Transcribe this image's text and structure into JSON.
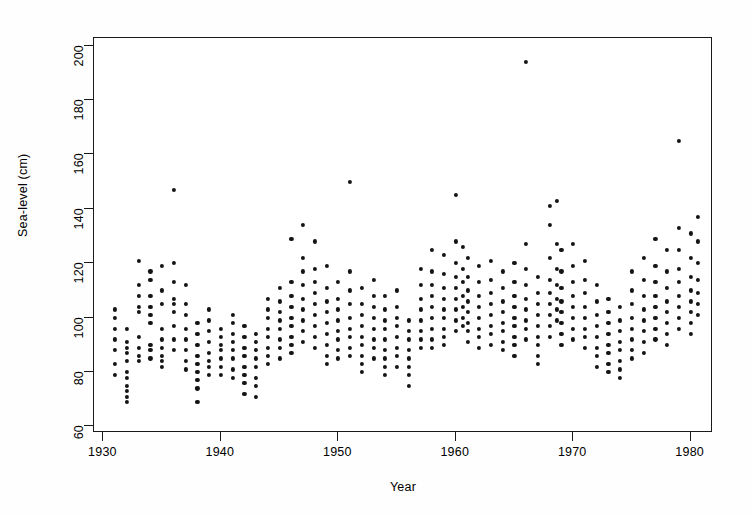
{
  "chart_data": {
    "type": "scatter",
    "title": "",
    "xlabel": "Year",
    "ylabel": "Sea-level (cm)",
    "xlim": [
      1929.2,
      1981.9
    ],
    "ylim": [
      57.6,
      202.8
    ],
    "xticks": [
      1930,
      1940,
      1950,
      1960,
      1970,
      1980
    ],
    "yticks": [
      60,
      80,
      100,
      120,
      140,
      160,
      180,
      200
    ],
    "grid": false,
    "legend": null,
    "marker": "filled-circle",
    "marker_color": "#141414",
    "frame_color": "#1a1a1a",
    "background": "#ffffff",
    "points": [
      [
        1931,
        103
      ],
      [
        1931,
        100
      ],
      [
        1931,
        96
      ],
      [
        1931,
        92
      ],
      [
        1931,
        88
      ],
      [
        1931,
        83
      ],
      [
        1931,
        79
      ],
      [
        1932,
        96
      ],
      [
        1932,
        91
      ],
      [
        1932,
        89
      ],
      [
        1932,
        87
      ],
      [
        1932,
        84
      ],
      [
        1932,
        80
      ],
      [
        1932,
        78
      ],
      [
        1932,
        75
      ],
      [
        1932,
        73
      ],
      [
        1932,
        71
      ],
      [
        1932,
        69
      ],
      [
        1933,
        121
      ],
      [
        1933,
        112
      ],
      [
        1933,
        108
      ],
      [
        1933,
        104
      ],
      [
        1933,
        102
      ],
      [
        1933,
        93
      ],
      [
        1933,
        89
      ],
      [
        1933,
        86
      ],
      [
        1933,
        84
      ],
      [
        1934,
        117
      ],
      [
        1934,
        114
      ],
      [
        1934,
        108
      ],
      [
        1934,
        104
      ],
      [
        1934,
        101
      ],
      [
        1934,
        98
      ],
      [
        1934,
        90
      ],
      [
        1934,
        88
      ],
      [
        1934,
        85
      ],
      [
        1935,
        119
      ],
      [
        1935,
        110
      ],
      [
        1935,
        105
      ],
      [
        1935,
        96
      ],
      [
        1935,
        92
      ],
      [
        1935,
        89
      ],
      [
        1935,
        86
      ],
      [
        1935,
        84
      ],
      [
        1935,
        82
      ],
      [
        1936,
        147
      ],
      [
        1936,
        120
      ],
      [
        1936,
        113
      ],
      [
        1936,
        107
      ],
      [
        1936,
        105
      ],
      [
        1936,
        102
      ],
      [
        1936,
        97
      ],
      [
        1936,
        92
      ],
      [
        1936,
        88
      ],
      [
        1937,
        112
      ],
      [
        1937,
        105
      ],
      [
        1937,
        101
      ],
      [
        1937,
        96
      ],
      [
        1937,
        92
      ],
      [
        1937,
        88
      ],
      [
        1937,
        84
      ],
      [
        1937,
        81
      ],
      [
        1938,
        98
      ],
      [
        1938,
        94
      ],
      [
        1938,
        90
      ],
      [
        1938,
        86
      ],
      [
        1938,
        83
      ],
      [
        1938,
        80
      ],
      [
        1938,
        77
      ],
      [
        1938,
        74
      ],
      [
        1938,
        69
      ],
      [
        1939,
        103
      ],
      [
        1939,
        99
      ],
      [
        1939,
        95
      ],
      [
        1939,
        91
      ],
      [
        1939,
        87
      ],
      [
        1939,
        84
      ],
      [
        1939,
        82
      ],
      [
        1939,
        79
      ],
      [
        1940,
        96
      ],
      [
        1940,
        93
      ],
      [
        1940,
        90
      ],
      [
        1940,
        88
      ],
      [
        1940,
        85
      ],
      [
        1940,
        82
      ],
      [
        1940,
        79
      ],
      [
        1941,
        101
      ],
      [
        1941,
        98
      ],
      [
        1941,
        94
      ],
      [
        1941,
        91
      ],
      [
        1941,
        88
      ],
      [
        1941,
        85
      ],
      [
        1941,
        81
      ],
      [
        1941,
        78
      ],
      [
        1942,
        97
      ],
      [
        1942,
        93
      ],
      [
        1942,
        89
      ],
      [
        1942,
        86
      ],
      [
        1942,
        82
      ],
      [
        1942,
        79
      ],
      [
        1942,
        76
      ],
      [
        1942,
        72
      ],
      [
        1943,
        94
      ],
      [
        1943,
        91
      ],
      [
        1943,
        88
      ],
      [
        1943,
        85
      ],
      [
        1943,
        82
      ],
      [
        1943,
        78
      ],
      [
        1943,
        75
      ],
      [
        1943,
        71
      ],
      [
        1944,
        107
      ],
      [
        1944,
        103
      ],
      [
        1944,
        100
      ],
      [
        1944,
        96
      ],
      [
        1944,
        93
      ],
      [
        1944,
        89
      ],
      [
        1944,
        86
      ],
      [
        1944,
        83
      ],
      [
        1945,
        111
      ],
      [
        1945,
        106
      ],
      [
        1945,
        102
      ],
      [
        1945,
        99
      ],
      [
        1945,
        96
      ],
      [
        1945,
        92
      ],
      [
        1945,
        89
      ],
      [
        1945,
        85
      ],
      [
        1946,
        129
      ],
      [
        1946,
        113
      ],
      [
        1946,
        108
      ],
      [
        1946,
        104
      ],
      [
        1946,
        100
      ],
      [
        1946,
        97
      ],
      [
        1946,
        93
      ],
      [
        1946,
        90
      ],
      [
        1946,
        87
      ],
      [
        1947,
        134
      ],
      [
        1947,
        122
      ],
      [
        1947,
        117
      ],
      [
        1947,
        112
      ],
      [
        1947,
        107
      ],
      [
        1947,
        103
      ],
      [
        1947,
        99
      ],
      [
        1947,
        95
      ],
      [
        1947,
        91
      ],
      [
        1948,
        128
      ],
      [
        1948,
        118
      ],
      [
        1948,
        113
      ],
      [
        1948,
        109
      ],
      [
        1948,
        105
      ],
      [
        1948,
        101
      ],
      [
        1948,
        97
      ],
      [
        1948,
        93
      ],
      [
        1948,
        89
      ],
      [
        1949,
        119
      ],
      [
        1949,
        111
      ],
      [
        1949,
        106
      ],
      [
        1949,
        102
      ],
      [
        1949,
        98
      ],
      [
        1949,
        94
      ],
      [
        1949,
        90
      ],
      [
        1949,
        86
      ],
      [
        1949,
        83
      ],
      [
        1950,
        113
      ],
      [
        1950,
        107
      ],
      [
        1950,
        103
      ],
      [
        1950,
        99
      ],
      [
        1950,
        95
      ],
      [
        1950,
        92
      ],
      [
        1950,
        88
      ],
      [
        1950,
        85
      ],
      [
        1951,
        150
      ],
      [
        1951,
        117
      ],
      [
        1951,
        110
      ],
      [
        1951,
        105
      ],
      [
        1951,
        100
      ],
      [
        1951,
        96
      ],
      [
        1951,
        93
      ],
      [
        1951,
        89
      ],
      [
        1951,
        86
      ],
      [
        1952,
        111
      ],
      [
        1952,
        105
      ],
      [
        1952,
        101
      ],
      [
        1952,
        97
      ],
      [
        1952,
        93
      ],
      [
        1952,
        90
      ],
      [
        1952,
        86
      ],
      [
        1952,
        83
      ],
      [
        1952,
        80
      ],
      [
        1953,
        114
      ],
      [
        1953,
        108
      ],
      [
        1953,
        104
      ],
      [
        1953,
        100
      ],
      [
        1953,
        96
      ],
      [
        1953,
        92
      ],
      [
        1953,
        89
      ],
      [
        1953,
        85
      ],
      [
        1954,
        108
      ],
      [
        1954,
        103
      ],
      [
        1954,
        99
      ],
      [
        1954,
        96
      ],
      [
        1954,
        92
      ],
      [
        1954,
        88
      ],
      [
        1954,
        85
      ],
      [
        1954,
        82
      ],
      [
        1954,
        79
      ],
      [
        1955,
        110
      ],
      [
        1955,
        104
      ],
      [
        1955,
        100
      ],
      [
        1955,
        97
      ],
      [
        1955,
        93
      ],
      [
        1955,
        89
      ],
      [
        1955,
        86
      ],
      [
        1955,
        82
      ],
      [
        1956,
        99
      ],
      [
        1956,
        95
      ],
      [
        1956,
        92
      ],
      [
        1956,
        88
      ],
      [
        1956,
        85
      ],
      [
        1956,
        82
      ],
      [
        1956,
        79
      ],
      [
        1956,
        75
      ],
      [
        1957,
        118
      ],
      [
        1957,
        112
      ],
      [
        1957,
        107
      ],
      [
        1957,
        103
      ],
      [
        1957,
        99
      ],
      [
        1957,
        95
      ],
      [
        1957,
        92
      ],
      [
        1957,
        89
      ],
      [
        1958,
        125
      ],
      [
        1958,
        117
      ],
      [
        1958,
        112
      ],
      [
        1958,
        108
      ],
      [
        1958,
        104
      ],
      [
        1958,
        100
      ],
      [
        1958,
        96
      ],
      [
        1958,
        92
      ],
      [
        1958,
        89
      ],
      [
        1959,
        123
      ],
      [
        1959,
        116
      ],
      [
        1959,
        111
      ],
      [
        1959,
        107
      ],
      [
        1959,
        103
      ],
      [
        1959,
        100
      ],
      [
        1959,
        96
      ],
      [
        1959,
        93
      ],
      [
        1959,
        90
      ],
      [
        1960,
        145
      ],
      [
        1960,
        128
      ],
      [
        1960,
        120
      ],
      [
        1960,
        115
      ],
      [
        1960,
        111
      ],
      [
        1960,
        107
      ],
      [
        1960,
        103
      ],
      [
        1960,
        99
      ],
      [
        1960,
        95
      ],
      [
        1960.6,
        126
      ],
      [
        1960.6,
        118
      ],
      [
        1960.6,
        113
      ],
      [
        1960.6,
        108
      ],
      [
        1960.6,
        104
      ],
      [
        1960.6,
        100
      ],
      [
        1960.6,
        97
      ],
      [
        1961,
        122
      ],
      [
        1961,
        115
      ],
      [
        1961,
        110
      ],
      [
        1961,
        106
      ],
      [
        1961,
        102
      ],
      [
        1961,
        98
      ],
      [
        1961,
        95
      ],
      [
        1961,
        91
      ],
      [
        1962,
        119
      ],
      [
        1962,
        113
      ],
      [
        1962,
        108
      ],
      [
        1962,
        104
      ],
      [
        1962,
        100
      ],
      [
        1962,
        96
      ],
      [
        1962,
        93
      ],
      [
        1962,
        89
      ],
      [
        1963,
        121
      ],
      [
        1963,
        114
      ],
      [
        1963,
        109
      ],
      [
        1963,
        105
      ],
      [
        1963,
        101
      ],
      [
        1963,
        97
      ],
      [
        1963,
        94
      ],
      [
        1963,
        90
      ],
      [
        1964,
        117
      ],
      [
        1964,
        111
      ],
      [
        1964,
        106
      ],
      [
        1964,
        102
      ],
      [
        1964,
        98
      ],
      [
        1964,
        95
      ],
      [
        1964,
        91
      ],
      [
        1964,
        88
      ],
      [
        1965,
        120
      ],
      [
        1965,
        113
      ],
      [
        1965,
        108
      ],
      [
        1965,
        104
      ],
      [
        1965,
        100
      ],
      [
        1965,
        97
      ],
      [
        1965,
        93
      ],
      [
        1965,
        90
      ],
      [
        1965,
        86
      ],
      [
        1966,
        194
      ],
      [
        1966,
        127
      ],
      [
        1966,
        118
      ],
      [
        1966,
        112
      ],
      [
        1966,
        107
      ],
      [
        1966,
        103
      ],
      [
        1966,
        99
      ],
      [
        1966,
        96
      ],
      [
        1966,
        92
      ],
      [
        1967,
        115
      ],
      [
        1967,
        109
      ],
      [
        1967,
        105
      ],
      [
        1967,
        101
      ],
      [
        1967,
        97
      ],
      [
        1967,
        93
      ],
      [
        1967,
        90
      ],
      [
        1967,
        86
      ],
      [
        1967,
        83
      ],
      [
        1968,
        141
      ],
      [
        1968,
        134
      ],
      [
        1968,
        122
      ],
      [
        1968,
        114
      ],
      [
        1968,
        109
      ],
      [
        1968,
        105
      ],
      [
        1968,
        101
      ],
      [
        1968,
        97
      ],
      [
        1968,
        93
      ],
      [
        1968.6,
        143
      ],
      [
        1968.6,
        127
      ],
      [
        1968.6,
        118
      ],
      [
        1968.6,
        112
      ],
      [
        1968.6,
        107
      ],
      [
        1968.6,
        103
      ],
      [
        1968.6,
        99
      ],
      [
        1969,
        125
      ],
      [
        1969,
        117
      ],
      [
        1969,
        111
      ],
      [
        1969,
        106
      ],
      [
        1969,
        102
      ],
      [
        1969,
        98
      ],
      [
        1969,
        94
      ],
      [
        1969,
        90
      ],
      [
        1970,
        127
      ],
      [
        1970,
        119
      ],
      [
        1970,
        113
      ],
      [
        1970,
        108
      ],
      [
        1970,
        104
      ],
      [
        1970,
        100
      ],
      [
        1970,
        96
      ],
      [
        1970,
        92
      ],
      [
        1971,
        121
      ],
      [
        1971,
        114
      ],
      [
        1971,
        109
      ],
      [
        1971,
        104
      ],
      [
        1971,
        100
      ],
      [
        1971,
        96
      ],
      [
        1971,
        93
      ],
      [
        1971,
        89
      ],
      [
        1972,
        112
      ],
      [
        1972,
        106
      ],
      [
        1972,
        101
      ],
      [
        1972,
        97
      ],
      [
        1972,
        93
      ],
      [
        1972,
        89
      ],
      [
        1972,
        86
      ],
      [
        1972,
        82
      ],
      [
        1973,
        107
      ],
      [
        1973,
        102
      ],
      [
        1973,
        98
      ],
      [
        1973,
        94
      ],
      [
        1973,
        90
      ],
      [
        1973,
        87
      ],
      [
        1973,
        83
      ],
      [
        1973,
        80
      ],
      [
        1974,
        104
      ],
      [
        1974,
        99
      ],
      [
        1974,
        95
      ],
      [
        1974,
        91
      ],
      [
        1974,
        88
      ],
      [
        1974,
        84
      ],
      [
        1974,
        81
      ],
      [
        1974,
        78
      ],
      [
        1975,
        117
      ],
      [
        1975,
        110
      ],
      [
        1975,
        105
      ],
      [
        1975,
        100
      ],
      [
        1975,
        96
      ],
      [
        1975,
        92
      ],
      [
        1975,
        88
      ],
      [
        1975,
        85
      ],
      [
        1976,
        122
      ],
      [
        1976,
        114
      ],
      [
        1976,
        108
      ],
      [
        1976,
        103
      ],
      [
        1976,
        99
      ],
      [
        1976,
        95
      ],
      [
        1976,
        91
      ],
      [
        1976,
        87
      ],
      [
        1977,
        129
      ],
      [
        1977,
        119
      ],
      [
        1977,
        113
      ],
      [
        1977,
        108
      ],
      [
        1977,
        104
      ],
      [
        1977,
        100
      ],
      [
        1977,
        96
      ],
      [
        1977,
        92
      ],
      [
        1978,
        125
      ],
      [
        1978,
        117
      ],
      [
        1978,
        111
      ],
      [
        1978,
        106
      ],
      [
        1978,
        102
      ],
      [
        1978,
        98
      ],
      [
        1978,
        94
      ],
      [
        1978,
        90
      ],
      [
        1979,
        165
      ],
      [
        1979,
        133
      ],
      [
        1979,
        125
      ],
      [
        1979,
        118
      ],
      [
        1979,
        113
      ],
      [
        1979,
        108
      ],
      [
        1979,
        104
      ],
      [
        1979,
        100
      ],
      [
        1979,
        96
      ],
      [
        1980,
        131
      ],
      [
        1980,
        122
      ],
      [
        1980,
        115
      ],
      [
        1980,
        110
      ],
      [
        1980,
        106
      ],
      [
        1980,
        102
      ],
      [
        1980,
        98
      ],
      [
        1980,
        94
      ],
      [
        1980.6,
        137
      ],
      [
        1980.6,
        128
      ],
      [
        1980.6,
        120
      ],
      [
        1980.6,
        114
      ],
      [
        1980.6,
        109
      ],
      [
        1980.6,
        105
      ],
      [
        1980.6,
        101
      ]
    ]
  },
  "axes": {
    "y_title": "Sea-level (cm)",
    "x_title": "Year",
    "y_tick_labels": [
      "200",
      "180",
      "160",
      "140",
      "120",
      "100",
      "80",
      "60"
    ],
    "x_tick_labels": [
      "1930",
      "1940",
      "1950",
      "1960",
      "1970",
      "1980"
    ]
  }
}
